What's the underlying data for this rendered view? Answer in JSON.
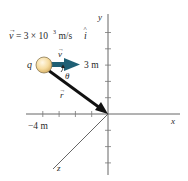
{
  "equation": {
    "vec_symbol": "v",
    "text": "= 3 × 10",
    "exponent": "3",
    "unit": " m/s ",
    "unit_vector": "i",
    "hat": "^"
  },
  "labels": {
    "charge": "q",
    "velocity": "v",
    "angle": "θ",
    "position": "r",
    "y_value": "3 m",
    "x_value": "−4 m",
    "x_axis": "x",
    "y_axis": "y",
    "z_axis": "z"
  },
  "colors": {
    "velocity_arrow": "#1f5f74",
    "position_arrow": "#111111",
    "charge_fill": "#f6dca0",
    "charge_stroke": "#8a7a55",
    "axes": "#555555"
  },
  "scene": {
    "charge_position_m": [
      -4,
      3,
      0
    ],
    "velocity_direction": "+x",
    "position_vector": "from charge to origin",
    "y_ticks_m": [
      1,
      2,
      3,
      4,
      5
    ],
    "y_ticks_negative_m": [
      -1,
      -2,
      -3
    ],
    "x_ticks_negative_m": [
      -1,
      -2,
      -3,
      -4
    ]
  }
}
